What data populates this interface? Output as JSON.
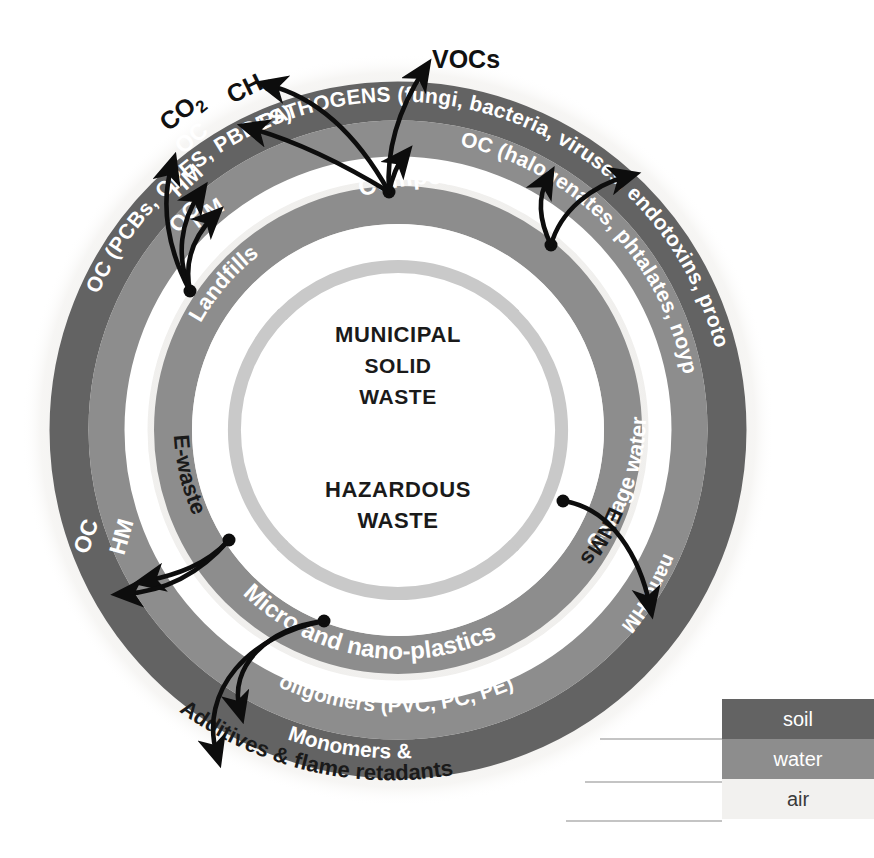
{
  "diagram": {
    "center": {
      "top_label_line1": "M",
      "top_label_line1_rest": "UNICIPAL",
      "top_label_line2": "SOLID",
      "top_label_line3": "WASTE",
      "bottom_label_line1": "H",
      "bottom_label_line1_rest": "AZARDOUS",
      "bottom_label_line2": "W",
      "bottom_label_line2_rest": "ASTE"
    },
    "center_text": {
      "municipal": "MUNICIPAL",
      "solid": "SOLID",
      "waste": "WASTE",
      "hazardous": "HAZARDOUS",
      "waste2": "WASTE"
    },
    "sources": [
      {
        "id": "landfills",
        "label": "Landfills"
      },
      {
        "id": "compost",
        "label": "Compost"
      },
      {
        "id": "sewage-water",
        "label": "Sewage water"
      },
      {
        "id": "enms",
        "label": "ENMs"
      },
      {
        "id": "micro-nano-plastics",
        "label": "Micro and nano-plastics"
      },
      {
        "id": "e-waste",
        "label": "E-waste"
      }
    ],
    "water_ring_labels": [
      {
        "id": "hm-left",
        "label": "HM"
      },
      {
        "id": "oc-top",
        "label": "OC"
      },
      {
        "id": "oc-halogenates",
        "label": "OC (halogenates, phtalates, noyphenols, PAHs, PCBs)"
      },
      {
        "id": "nano-hm",
        "label": "nano-HM"
      },
      {
        "id": "hm-lower-left",
        "label": "HM"
      },
      {
        "id": "monomers-oligomers",
        "label": "Monomers & oligomers (PVC, PC, PE)"
      }
    ],
    "soil_ring_labels": [
      {
        "id": "oc-pcbs",
        "label": "OC (PCBs, OPES, PBDES)"
      },
      {
        "id": "pathogens",
        "label": "PATHOGENS (fungi, bacteria, viruses, endotoxins, protozoa)"
      }
    ],
    "air_labels": [
      {
        "id": "co2",
        "label": "CO",
        "sub": "2"
      },
      {
        "id": "ch4",
        "label": "CH",
        "sub": "4"
      },
      {
        "id": "vocs",
        "label": "VOCs"
      },
      {
        "id": "additives",
        "label": "Additives & flame retadants"
      }
    ],
    "plain": {
      "co2": "CO",
      "co2_sub": "2",
      "ch4": "CH",
      "ch4_sub": "4",
      "vocs": "VOCs",
      "additives": "Additives & flame retadants",
      "oc_short_top": "OC",
      "hm_short_top": "HM",
      "oc_short_left": "OC",
      "hm_short_left": "HM",
      "oc_pcbs": "OC (PCBs, OPES, PBDES)",
      "pathogens": "PATHOGENS (fungi, bacteria, viruses, endotoxins, protozoa)",
      "oc_halogenates": "OC (halogenates, phtalates, noyphenols, PAHs, PCBs)",
      "nano_hm": "nano-HM",
      "monomers_line1": "Monomers &",
      "monomers_line2": "oligomers (PVC, PC, PE)",
      "landfills": "Landfills",
      "compost": "Compost",
      "sewage_water": "Sewage water",
      "enms": "ENMs",
      "micro_nano": "Micro and nano-plastics",
      "ewaste": "E-waste"
    }
  },
  "legend": {
    "items": [
      {
        "id": "soil",
        "label": "soil",
        "color": "#636363"
      },
      {
        "id": "water",
        "label": "water",
        "color": "#8d8d8d"
      },
      {
        "id": "air",
        "label": "air",
        "color": "#f2f1ef"
      }
    ]
  },
  "colors": {
    "soil": "#636363",
    "water": "#8d8d8d",
    "air": "#f2f1ef",
    "inner_arc": "#c9c9c9",
    "arrow": "#0d0d0d",
    "text_light": "#ffffff",
    "text_dark": "#1a1a1a",
    "background": "#ffffff"
  }
}
